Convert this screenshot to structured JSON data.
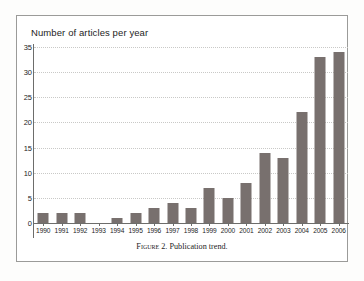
{
  "figure": {
    "caption_label": "Figure 2.",
    "caption_text": "Publication trend."
  },
  "chart_data": {
    "type": "bar",
    "title": "Number of articles per year",
    "xlabel": "",
    "ylabel": "",
    "categories": [
      "1990",
      "1991",
      "1992",
      "1993",
      "1994",
      "1995",
      "1996",
      "1997",
      "1998",
      "1999",
      "2000",
      "2001",
      "2002",
      "2003",
      "2004",
      "2005",
      "2006"
    ],
    "values": [
      2,
      2,
      2,
      0,
      1,
      2,
      3,
      4,
      3,
      7,
      5,
      8,
      14,
      13,
      22,
      33,
      34
    ],
    "ylim": [
      0,
      35
    ],
    "ytick_labels": [
      "0",
      "5",
      "10",
      "15",
      "20",
      "25",
      "30",
      "35"
    ],
    "ytick_values": [
      0,
      5,
      10,
      15,
      20,
      25,
      30,
      35
    ],
    "grid": true,
    "grid_axis": "y",
    "legend": null,
    "bar_color": "#78706e",
    "grid_color": "#c9c9c7",
    "axis_color": "#6d6d6b",
    "text_color": "#1d1d1d",
    "background": "#ffffff"
  }
}
